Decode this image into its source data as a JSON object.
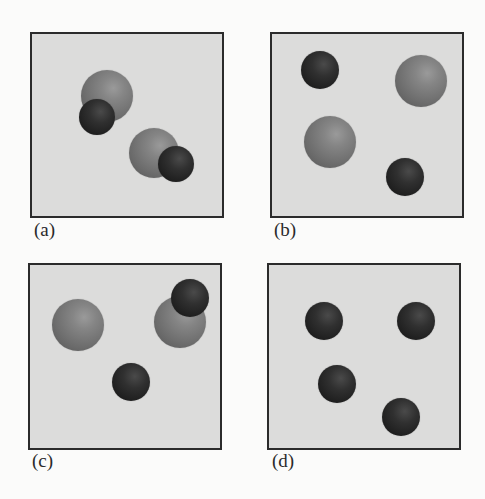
{
  "figure": {
    "panels": [
      {
        "id": "a",
        "label": "(a)",
        "box": {
          "left": 30,
          "top": 32,
          "width": 194,
          "height": 186
        },
        "label_pos": {
          "left": 34,
          "top": 219
        },
        "description": "Two diatomic molecules, each a large gray atom bonded to a small dark atom",
        "spheres": [
          {
            "type": "large",
            "cx": 107,
            "cy": 96,
            "r": 26
          },
          {
            "type": "small",
            "cx": 97,
            "cy": 117,
            "r": 18
          },
          {
            "type": "large",
            "cx": 154,
            "cy": 153,
            "r": 25
          },
          {
            "type": "small",
            "cx": 176,
            "cy": 164,
            "r": 18
          }
        ]
      },
      {
        "id": "b",
        "label": "(b)",
        "box": {
          "left": 270,
          "top": 32,
          "width": 194,
          "height": 186
        },
        "label_pos": {
          "left": 274,
          "top": 219
        },
        "description": "Four separate atoms: two large gray, two small dark",
        "spheres": [
          {
            "type": "small",
            "cx": 320,
            "cy": 70,
            "r": 19
          },
          {
            "type": "large",
            "cx": 421,
            "cy": 81,
            "r": 26
          },
          {
            "type": "large",
            "cx": 330,
            "cy": 142,
            "r": 26
          },
          {
            "type": "small",
            "cx": 405,
            "cy": 177,
            "r": 19
          }
        ]
      },
      {
        "id": "c",
        "label": "(c)",
        "box": {
          "left": 28,
          "top": 263,
          "width": 194,
          "height": 187
        },
        "label_pos": {
          "left": 32,
          "top": 450
        },
        "description": "One diatomic molecule plus one free large atom and one free small atom",
        "spheres": [
          {
            "type": "large",
            "cx": 78,
            "cy": 325,
            "r": 26
          },
          {
            "type": "large",
            "cx": 180,
            "cy": 322,
            "r": 26
          },
          {
            "type": "small",
            "cx": 190,
            "cy": 298,
            "r": 19
          },
          {
            "type": "small",
            "cx": 131,
            "cy": 382,
            "r": 19
          }
        ]
      },
      {
        "id": "d",
        "label": "(d)",
        "box": {
          "left": 267,
          "top": 263,
          "width": 194,
          "height": 187
        },
        "label_pos": {
          "left": 272,
          "top": 450
        },
        "description": "Four separate small dark atoms",
        "spheres": [
          {
            "type": "small",
            "cx": 324,
            "cy": 321,
            "r": 19
          },
          {
            "type": "small",
            "cx": 416,
            "cy": 321,
            "r": 19
          },
          {
            "type": "small",
            "cx": 337,
            "cy": 384,
            "r": 19
          },
          {
            "type": "small",
            "cx": 401,
            "cy": 417,
            "r": 19
          }
        ]
      }
    ],
    "colors": {
      "background": "#fbfbfa",
      "panel_fill": "#dcdcdb",
      "panel_border": "#2b2b2b",
      "large_atom": "#7a7a7a",
      "small_atom": "#262626"
    }
  }
}
